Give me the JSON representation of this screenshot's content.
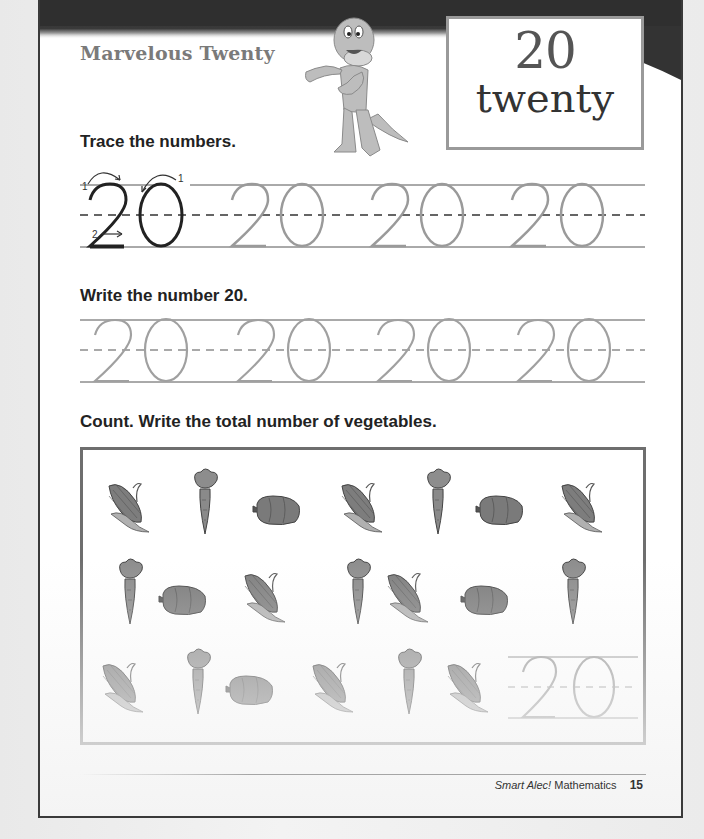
{
  "worksheet": {
    "title": "Marvelous Twenty",
    "number_box": {
      "numeral": "20",
      "word": "twenty"
    },
    "mascot": "dragon-mascot"
  },
  "sections": {
    "trace": {
      "instruction": "Trace the numbers.",
      "model_number": "20",
      "stroke_labels": [
        "1",
        "2",
        "1"
      ],
      "trace_numbers": [
        "20",
        "20",
        "20"
      ]
    },
    "write": {
      "instruction": "Write the number 20.",
      "guide_numbers": [
        "20",
        "20",
        "20",
        "20"
      ]
    },
    "count": {
      "instruction": "Count. Write the total number of vegetables.",
      "rows": [
        [
          "corn",
          "carrot",
          "pepper",
          "corn",
          "carrot",
          "pepper",
          "corn"
        ],
        [
          "carrot",
          "pepper",
          "corn",
          "carrot",
          "corn",
          "pepper",
          "carrot"
        ],
        [
          "corn",
          "carrot",
          "pepper",
          "corn",
          "carrot",
          "corn"
        ]
      ],
      "answer": "20"
    }
  },
  "footer": {
    "brand": "Smart Alec!",
    "subject": "Mathematics",
    "page_number": "15"
  },
  "colors": {
    "band": "#2e2e2e",
    "title": "#7a7a7a",
    "trace_gray": "#9a9a9a",
    "border": "#3a3a3a"
  }
}
